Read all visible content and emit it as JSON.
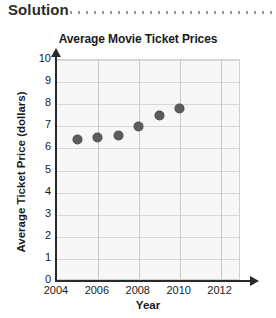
{
  "header": {
    "label": "Solution",
    "dots_icon": "dotted-rule"
  },
  "chart_data": {
    "type": "scatter",
    "title": "Average Movie Ticket Prices",
    "xlabel": "Year",
    "ylabel": "Average Ticket Price (dollars)",
    "xlim": [
      2004,
      2013
    ],
    "ylim": [
      0,
      10
    ],
    "x_ticks": [
      2004,
      2006,
      2008,
      2010,
      2012
    ],
    "y_ticks": [
      0,
      1,
      2,
      3,
      4,
      5,
      6,
      7,
      8,
      9,
      10
    ],
    "grid": true,
    "legend": "none",
    "point_color": "#5c5c5c",
    "x": [
      2005,
      2006,
      2007,
      2008,
      2009,
      2010
    ],
    "values": [
      6.4,
      6.5,
      6.6,
      7.0,
      7.5,
      7.8
    ],
    "points": [
      {
        "x": 2005,
        "y": 6.4
      },
      {
        "x": 2006,
        "y": 6.5
      },
      {
        "x": 2007,
        "y": 6.6
      },
      {
        "x": 2008,
        "y": 7.0
      },
      {
        "x": 2009,
        "y": 7.5
      },
      {
        "x": 2010,
        "y": 7.8
      }
    ]
  }
}
